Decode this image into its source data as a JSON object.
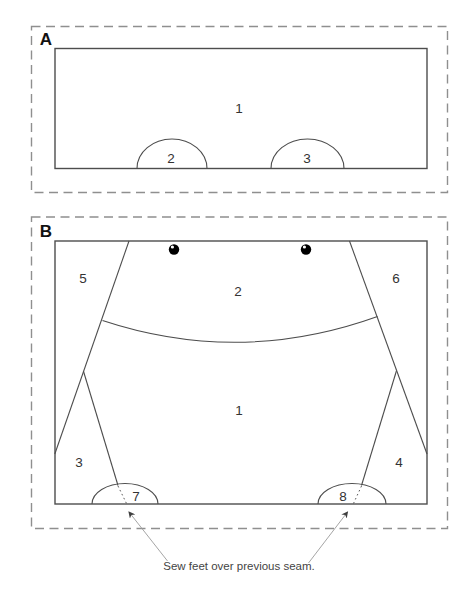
{
  "panel_a": {
    "label": "A",
    "regions": {
      "body": "1",
      "bump_left": "2",
      "bump_right": "3"
    }
  },
  "panel_b": {
    "label": "B",
    "regions": {
      "body": "1",
      "head": "2",
      "leg_left": "3",
      "leg_right": "4",
      "side_left": "5",
      "side_right": "6",
      "foot_left": "7",
      "foot_right": "8"
    }
  },
  "annotation": {
    "label": "Sew feet over previous seam."
  },
  "colors": {
    "outline": "#4d4d4d",
    "dashed_border": "#8f8f8f",
    "label_text": "#333333",
    "panel_letter": "#111111",
    "annotation_line": "#9b9b9b",
    "bead": "#000000"
  }
}
